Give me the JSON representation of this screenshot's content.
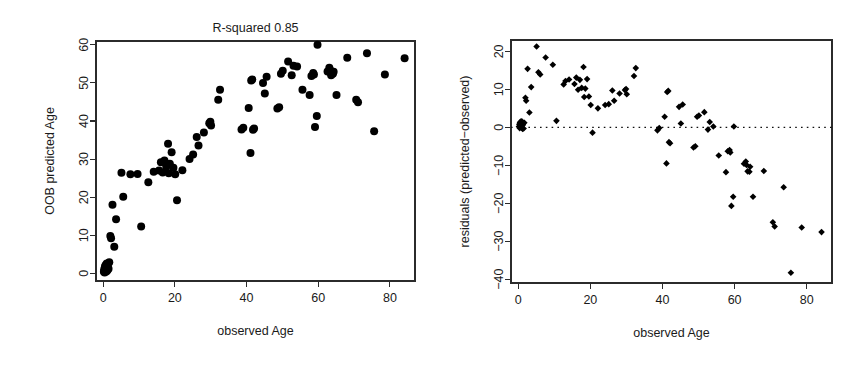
{
  "figure": {
    "name": "random-forest-age-prediction-figure",
    "background": "#ffffff",
    "point_color": "#000000",
    "axis_color": "#2b2b2b"
  },
  "chart_data": [
    {
      "type": "scatter",
      "panel": "left",
      "title": "R-squared 0.85",
      "xlabel": "observed Age",
      "ylabel": "OOB predicted Age",
      "xlim": [
        -2,
        87
      ],
      "ylim": [
        -2,
        61
      ],
      "xticks": [
        0,
        20,
        40,
        60,
        80
      ],
      "yticks": [
        0,
        10,
        20,
        30,
        40,
        50,
        60
      ],
      "grid": false,
      "legend": null,
      "marker": "filled-circle",
      "points": [
        [
          0.2,
          0.4
        ],
        [
          0.3,
          1.1
        ],
        [
          0.4,
          0.2
        ],
        [
          0.5,
          1.8
        ],
        [
          0.6,
          0.9
        ],
        [
          0.7,
          2.2
        ],
        [
          0.8,
          1.3
        ],
        [
          0.9,
          0.5
        ],
        [
          1.0,
          2.6
        ],
        [
          1.1,
          1.6
        ],
        [
          1.2,
          0.8
        ],
        [
          1.3,
          2.0
        ],
        [
          1.5,
          1.2
        ],
        [
          1.7,
          2.9
        ],
        [
          2.0,
          9.8
        ],
        [
          2.2,
          9.2
        ],
        [
          3.1,
          7.0
        ],
        [
          2.6,
          18.0
        ],
        [
          3.6,
          14.2
        ],
        [
          5.1,
          26.4
        ],
        [
          5.6,
          20.1
        ],
        [
          7.6,
          26.0
        ],
        [
          9.6,
          26.1
        ],
        [
          10.6,
          12.3
        ],
        [
          12.6,
          23.9
        ],
        [
          14.1,
          26.7
        ],
        [
          15.6,
          27.0
        ],
        [
          16.1,
          29.2
        ],
        [
          16.6,
          26.5
        ],
        [
          17.1,
          29.6
        ],
        [
          17.6,
          28.0
        ],
        [
          18.1,
          34.0
        ],
        [
          18.3,
          26.3
        ],
        [
          18.6,
          28.8
        ],
        [
          19.1,
          31.8
        ],
        [
          19.6,
          27.7
        ],
        [
          20.1,
          26.0
        ],
        [
          20.6,
          19.2
        ],
        [
          22.1,
          27.1
        ],
        [
          24.1,
          30.0
        ],
        [
          25.1,
          31.2
        ],
        [
          26.1,
          35.8
        ],
        [
          26.6,
          33.6
        ],
        [
          28.1,
          37.0
        ],
        [
          29.6,
          39.4
        ],
        [
          29.9,
          39.8
        ],
        [
          30.1,
          38.8
        ],
        [
          32.1,
          45.6
        ],
        [
          32.6,
          48.2
        ],
        [
          38.6,
          37.8
        ],
        [
          39.1,
          38.2
        ],
        [
          40.6,
          43.4
        ],
        [
          41.1,
          31.6
        ],
        [
          41.3,
          50.6
        ],
        [
          41.6,
          50.9
        ],
        [
          41.8,
          37.7
        ],
        [
          42.1,
          38.0
        ],
        [
          44.6,
          50.0
        ],
        [
          45.1,
          47.2
        ],
        [
          45.6,
          51.6
        ],
        [
          48.6,
          43.3
        ],
        [
          49.1,
          43.6
        ],
        [
          49.6,
          52.4
        ],
        [
          50.1,
          53.2
        ],
        [
          51.6,
          55.6
        ],
        [
          52.6,
          52.0
        ],
        [
          53.1,
          54.5
        ],
        [
          54.1,
          54.3
        ],
        [
          55.6,
          48.2
        ],
        [
          57.6,
          46.8
        ],
        [
          58.1,
          51.8
        ],
        [
          58.6,
          52.6
        ],
        [
          58.8,
          52.2
        ],
        [
          59.1,
          38.4
        ],
        [
          59.6,
          41.3
        ],
        [
          59.8,
          60.0
        ],
        [
          62.6,
          53.0
        ],
        [
          63.1,
          54.0
        ],
        [
          63.3,
          53.4
        ],
        [
          63.6,
          52.0
        ],
        [
          64.1,
          52.4
        ],
        [
          64.3,
          52.9
        ],
        [
          65.1,
          46.8
        ],
        [
          68.1,
          56.6
        ],
        [
          70.6,
          45.6
        ],
        [
          71.1,
          44.9
        ],
        [
          73.6,
          57.8
        ],
        [
          75.6,
          37.3
        ],
        [
          78.6,
          52.2
        ],
        [
          84.1,
          56.5
        ]
      ]
    },
    {
      "type": "scatter",
      "panel": "right",
      "title": "",
      "xlabel": "observed Age",
      "ylabel": "residuals (predicted−observed)",
      "xlim": [
        -2,
        87
      ],
      "ylim": [
        -41,
        23
      ],
      "xticks": [
        0,
        20,
        40,
        60,
        80
      ],
      "yticks": [
        -40,
        -30,
        -20,
        -10,
        0,
        10,
        20
      ],
      "grid": false,
      "legend": null,
      "marker": "filled-diamond",
      "reference_line": {
        "type": "horizontal",
        "y": 0,
        "style": "dotted"
      },
      "points": [
        [
          0.2,
          0.2
        ],
        [
          0.3,
          0.8
        ],
        [
          0.4,
          -0.2
        ],
        [
          0.5,
          1.3
        ],
        [
          0.6,
          0.3
        ],
        [
          0.7,
          1.5
        ],
        [
          0.8,
          0.7
        ],
        [
          0.9,
          -0.1
        ],
        [
          1.0,
          1.6
        ],
        [
          1.1,
          0.5
        ],
        [
          1.2,
          -0.4
        ],
        [
          1.3,
          0.7
        ],
        [
          1.5,
          -0.3
        ],
        [
          1.7,
          1.2
        ],
        [
          2.0,
          7.8
        ],
        [
          2.2,
          7.0
        ],
        [
          2.6,
          15.4
        ],
        [
          3.1,
          3.9
        ],
        [
          3.6,
          10.6
        ],
        [
          5.1,
          21.3
        ],
        [
          5.6,
          14.5
        ],
        [
          6.1,
          13.9
        ],
        [
          7.6,
          18.4
        ],
        [
          9.6,
          16.5
        ],
        [
          10.6,
          1.7
        ],
        [
          12.6,
          11.3
        ],
        [
          13.1,
          12.2
        ],
        [
          14.1,
          12.6
        ],
        [
          15.6,
          11.4
        ],
        [
          16.1,
          13.1
        ],
        [
          16.6,
          9.9
        ],
        [
          17.1,
          12.5
        ],
        [
          17.6,
          10.4
        ],
        [
          18.1,
          15.9
        ],
        [
          18.3,
          8.0
        ],
        [
          18.6,
          10.2
        ],
        [
          19.1,
          12.7
        ],
        [
          19.6,
          8.1
        ],
        [
          20.1,
          5.9
        ],
        [
          20.6,
          -1.4
        ],
        [
          22.1,
          5.0
        ],
        [
          24.1,
          5.9
        ],
        [
          25.1,
          6.1
        ],
        [
          26.1,
          9.7
        ],
        [
          26.6,
          7.0
        ],
        [
          28.1,
          8.9
        ],
        [
          29.6,
          9.8
        ],
        [
          29.9,
          10.1
        ],
        [
          30.1,
          8.7
        ],
        [
          32.1,
          13.5
        ],
        [
          32.6,
          15.6
        ],
        [
          38.6,
          -0.8
        ],
        [
          39.1,
          -0.2
        ],
        [
          40.6,
          2.8
        ],
        [
          41.1,
          -9.5
        ],
        [
          41.3,
          9.3
        ],
        [
          41.6,
          9.6
        ],
        [
          41.8,
          -3.9
        ],
        [
          42.1,
          -4.2
        ],
        [
          44.6,
          5.4
        ],
        [
          45.1,
          1.0
        ],
        [
          45.6,
          6.0
        ],
        [
          48.6,
          -5.3
        ],
        [
          49.1,
          -5.0
        ],
        [
          49.6,
          2.8
        ],
        [
          50.1,
          3.1
        ],
        [
          51.6,
          4.0
        ],
        [
          52.6,
          -0.6
        ],
        [
          53.1,
          1.4
        ],
        [
          54.1,
          0.2
        ],
        [
          55.6,
          -7.4
        ],
        [
          57.6,
          -11.8
        ],
        [
          58.1,
          -6.3
        ],
        [
          58.6,
          -6.0
        ],
        [
          58.8,
          -6.6
        ],
        [
          59.1,
          -20.7
        ],
        [
          59.6,
          -18.3
        ],
        [
          59.8,
          0.2
        ],
        [
          62.6,
          -9.6
        ],
        [
          63.1,
          -9.0
        ],
        [
          63.3,
          -9.9
        ],
        [
          63.6,
          -11.6
        ],
        [
          64.1,
          -11.7
        ],
        [
          64.3,
          -10.4
        ],
        [
          65.1,
          -18.3
        ],
        [
          68.1,
          -11.5
        ],
        [
          70.6,
          -25.0
        ],
        [
          71.1,
          -26.1
        ],
        [
          73.6,
          -15.8
        ],
        [
          75.6,
          -38.3
        ],
        [
          78.6,
          -26.4
        ],
        [
          84.1,
          -27.6
        ]
      ]
    }
  ]
}
